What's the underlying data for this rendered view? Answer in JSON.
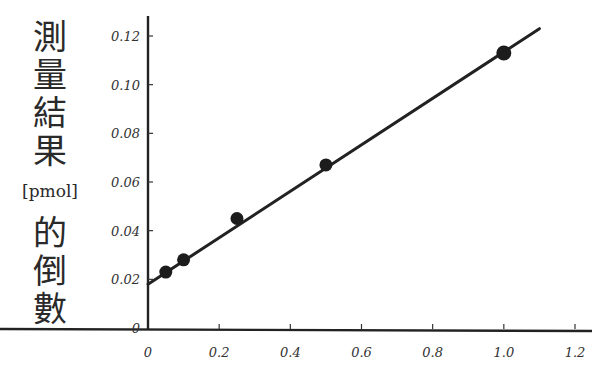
{
  "chart_data": {
    "type": "scatter",
    "title": "",
    "xlabel": "",
    "ylabel": "測量結果 [pmol] 的倒數",
    "ylabel_parts": {
      "chars_top": [
        "測",
        "量",
        "結",
        "果"
      ],
      "unit": "[pmol]",
      "chars_bottom": [
        "的",
        "倒",
        "數"
      ]
    },
    "xlim": [
      0,
      1.2
    ],
    "ylim": [
      0,
      0.12
    ],
    "x_ticks": [
      "0",
      "0.2",
      "0.4",
      "0.6",
      "0.8",
      "1.0",
      "1.2"
    ],
    "y_ticks": [
      "0",
      "0.02",
      "0.04",
      "0.06",
      "0.08",
      "0.10",
      "0.12"
    ],
    "grid": false,
    "legend": null,
    "series": [
      {
        "name": "measured",
        "type": "scatter",
        "x": [
          0.05,
          0.1,
          0.25,
          0.5,
          1.0
        ],
        "y": [
          0.023,
          0.028,
          0.045,
          0.067,
          0.113
        ]
      },
      {
        "name": "fit line",
        "type": "line",
        "x": [
          0,
          1.1
        ],
        "y": [
          0.018,
          0.123
        ]
      }
    ]
  }
}
